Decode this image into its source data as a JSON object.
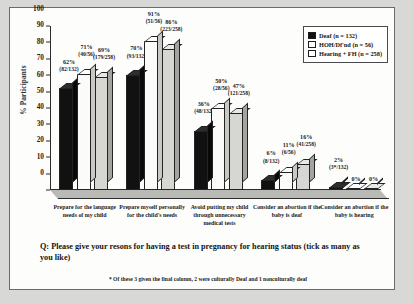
{
  "chart_data": {
    "type": "bar",
    "title": "",
    "xlabel": "",
    "ylabel": "% Participants",
    "ylim": [
      0,
      100
    ],
    "yticks": [
      100,
      90,
      80,
      70,
      60,
      50,
      40,
      30,
      20,
      10,
      0
    ],
    "grid": false,
    "legend_position": "top-right",
    "categories": [
      "Prepare for the language needs of my child",
      "Prepare myself personally for the child's needs",
      "Avoid putting my child through unnecessary medical tests",
      "Consider an abortion if the baby is deaf",
      "Consider an abortion if the baby is hearing"
    ],
    "series": [
      {
        "name": "Deaf (n = 132)",
        "color": "#111111",
        "values": [
          62,
          70,
          36,
          6,
          2
        ],
        "labels": [
          "62%",
          "70%",
          "36%",
          "6%",
          "2%"
        ],
        "fractions": [
          "(82/132)",
          "(93/132)",
          "(48/132)",
          "(8/132)",
          "(3*/132)"
        ]
      },
      {
        "name": "HOH/Df'nd (n = 56)",
        "color": "#ffffff",
        "values": [
          71,
          91,
          50,
          11,
          0
        ],
        "labels": [
          "71%",
          "91%",
          "50%",
          "11%",
          "0%"
        ],
        "fractions": [
          "(40/56)",
          "(51/56)",
          "(28/56)",
          "(6/56)",
          ""
        ]
      },
      {
        "name": "Hearing + FH (n = 258)",
        "color": "#d6d6d2",
        "values": [
          69,
          86,
          47,
          16,
          0
        ],
        "labels": [
          "69%",
          "86%",
          "47%",
          "16%",
          "0%"
        ],
        "fractions": [
          "(179/258)",
          "(223/258)",
          "(121/258)",
          "(41/258)",
          ""
        ]
      }
    ],
    "caption": "Q: Please give your resons for having a test in pregnancy for hearing status (tick as many as you like)",
    "footnote": "* Of these 3 given the final column, 2 were culturally Deaf and 1 nonculturally deaf"
  },
  "legend": {
    "items": [
      "Deaf  (n = 132)",
      "HOH/Df'nd (n = 56)",
      "Hearing + FH (n = 258)"
    ]
  }
}
